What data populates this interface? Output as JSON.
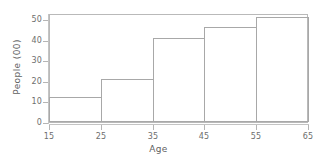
{
  "chart_data": {
    "type": "bar",
    "title": "",
    "subtitle": "",
    "xlabel": "Age",
    "ylabel": "People (00)",
    "categories": [
      "15-25",
      "25-35",
      "35-45",
      "45-55",
      "55-65"
    ],
    "values": [
      12,
      21,
      41,
      46,
      51
    ],
    "bin_edges": [
      15,
      25,
      35,
      45,
      55,
      65
    ],
    "xlim": [
      15,
      65
    ],
    "ylim": [
      0,
      53
    ],
    "xticks": [
      15,
      25,
      35,
      45,
      55,
      65
    ],
    "yticks": [
      0,
      10,
      20,
      30,
      40,
      50
    ],
    "xtick_labels": [
      "15",
      "25",
      "35",
      "45",
      "55",
      "65"
    ],
    "ytick_labels": [
      "0",
      "10",
      "20",
      "30",
      "40",
      "50"
    ],
    "grid": false,
    "legend": null,
    "legend_position": "none",
    "bar_fill": "none",
    "bar_edge_color": "#a8a8a8",
    "axis_color": "#b9b9b9",
    "text_color": "#6e6e6e",
    "background": "#ffffff",
    "annotations": []
  }
}
